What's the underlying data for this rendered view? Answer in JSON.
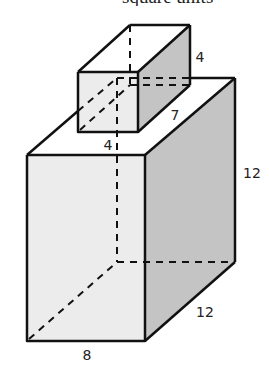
{
  "header": {
    "fragment_text": "square units"
  },
  "diagram": {
    "colors": {
      "front_face": "#ececec",
      "side_face": "#c4c4c4",
      "top_face": "#ffffff",
      "edge": "#111111"
    },
    "small_prism": {
      "labels": {
        "height": "4",
        "depth": "7",
        "width": "4"
      }
    },
    "large_prism": {
      "labels": {
        "height": "12",
        "depth": "12",
        "width": "8"
      }
    }
  }
}
